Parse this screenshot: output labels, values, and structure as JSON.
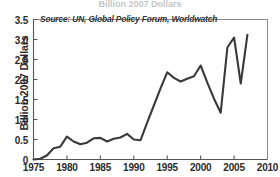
{
  "figure": {
    "cut_off_title": "Billion 2007 Dollars",
    "source_note": "Source: UN, Global Policy Forum, Worldwatch",
    "line_color": "#3a3a3a",
    "axis_color": "#555555",
    "background": "#ffffff"
  },
  "chart_data": {
    "type": "line",
    "title": "",
    "subtitle": "",
    "xlabel": "",
    "ylabel": "Billion 2007 Dollars",
    "annotations": [
      "Source: UN, Global Policy Forum, Worldwatch"
    ],
    "grid": false,
    "legend": null,
    "xlim": [
      1975,
      2010
    ],
    "ylim": [
      0,
      3.5
    ],
    "xticks": [
      1975,
      1980,
      1985,
      1990,
      1995,
      2000,
      2005,
      2010
    ],
    "xticklabels": [
      "1975",
      "1980",
      "1985",
      "1990",
      "1995",
      "2000",
      "2005",
      "2010"
    ],
    "yticks": [
      0,
      0.5,
      1.0,
      1.5,
      2.0,
      2.5,
      3.0,
      3.5
    ],
    "yticklabels": [
      "0",
      "0.5",
      "1.0",
      "1.5",
      "2.0",
      "2.5",
      "3.0",
      "3.5"
    ],
    "x": [
      1975,
      1976,
      1977,
      1978,
      1979,
      1980,
      1981,
      1982,
      1983,
      1984,
      1985,
      1986,
      1987,
      1988,
      1989,
      1990,
      1991,
      1992,
      1993,
      1994,
      1995,
      1996,
      1997,
      1998,
      1999,
      2000,
      2001,
      2002,
      2003,
      2004,
      2005,
      2006,
      2007
    ],
    "values": [
      0.0,
      0.02,
      0.1,
      0.28,
      0.32,
      0.57,
      0.45,
      0.38,
      0.42,
      0.53,
      0.54,
      0.45,
      0.52,
      0.55,
      0.64,
      0.5,
      0.48,
      0.92,
      1.35,
      1.78,
      2.18,
      2.04,
      1.95,
      2.02,
      2.08,
      2.35,
      1.92,
      1.52,
      1.17,
      2.8,
      3.05,
      1.9,
      3.12
    ],
    "series": [
      {
        "name": "UN peacekeeping expenditures",
        "values": [
          0.0,
          0.02,
          0.1,
          0.28,
          0.32,
          0.57,
          0.45,
          0.38,
          0.42,
          0.53,
          0.54,
          0.45,
          0.52,
          0.55,
          0.64,
          0.5,
          0.48,
          0.92,
          1.35,
          1.78,
          2.18,
          2.04,
          1.95,
          2.02,
          2.08,
          2.35,
          1.92,
          1.52,
          1.17,
          2.8,
          3.05,
          1.9,
          3.12
        ]
      }
    ]
  }
}
